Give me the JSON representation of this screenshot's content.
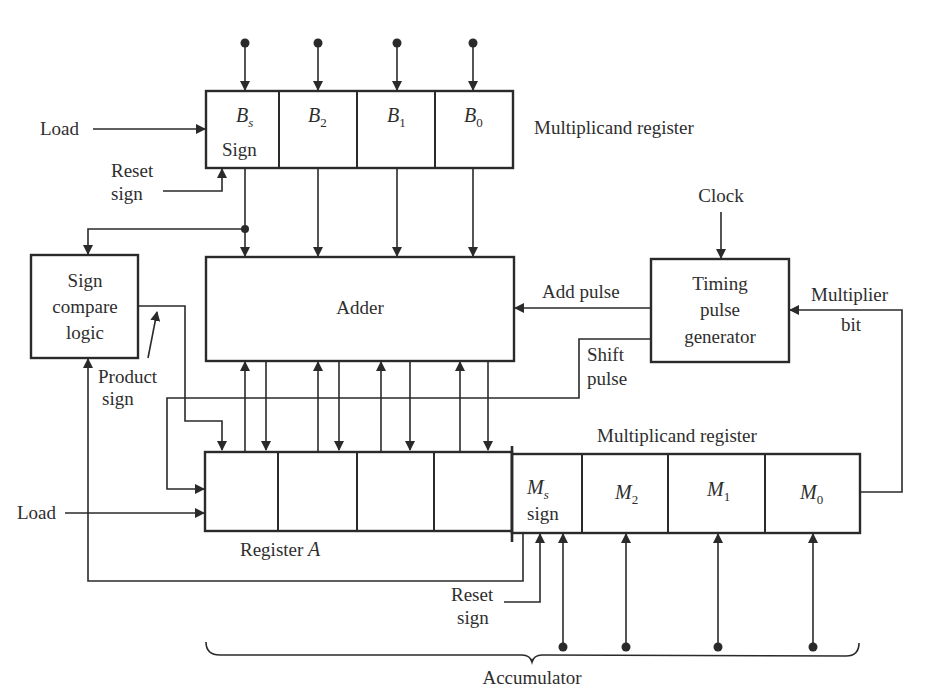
{
  "diagram": {
    "type": "block-diagram"
  },
  "register_b": {
    "label": "Multiplicand register",
    "cells": [
      {
        "symbol": "B",
        "sub": "s",
        "extra": "Sign"
      },
      {
        "symbol": "B",
        "sub": "2",
        "extra": ""
      },
      {
        "symbol": "B",
        "sub": "1",
        "extra": ""
      },
      {
        "symbol": "B",
        "sub": "0",
        "extra": ""
      }
    ],
    "load_label": "Load",
    "reset_label_1": "Reset",
    "reset_label_2": "sign"
  },
  "adder": {
    "label": "Adder"
  },
  "sign_compare": {
    "line1": "Sign",
    "line2": "compare",
    "line3": "logic"
  },
  "product_sign": {
    "line1": "Product",
    "line2": "sign"
  },
  "timing": {
    "line1": "Timing",
    "line2": "pulse",
    "line3": "generator",
    "clock_label": "Clock",
    "add_pulse_label": "Add pulse",
    "shift_label_1": "Shift",
    "shift_label_2": "pulse",
    "mult_bit_1": "Multiplier",
    "mult_bit_2": "bit"
  },
  "register_a": {
    "label_text": "Register ",
    "label_var": "A",
    "load_label": "Load"
  },
  "register_m": {
    "label": "Multiplicand register",
    "cells": [
      {
        "symbol": "M",
        "sub": "s",
        "extra": "sign"
      },
      {
        "symbol": "M",
        "sub": "2",
        "extra": ""
      },
      {
        "symbol": "M",
        "sub": "1",
        "extra": ""
      },
      {
        "symbol": "M",
        "sub": "0",
        "extra": ""
      }
    ],
    "reset_label_1": "Reset",
    "reset_label_2": "sign"
  },
  "accumulator": {
    "label": "Accumulator"
  },
  "colors": {
    "ink": "#2a2a2a",
    "background": "#ffffff"
  }
}
